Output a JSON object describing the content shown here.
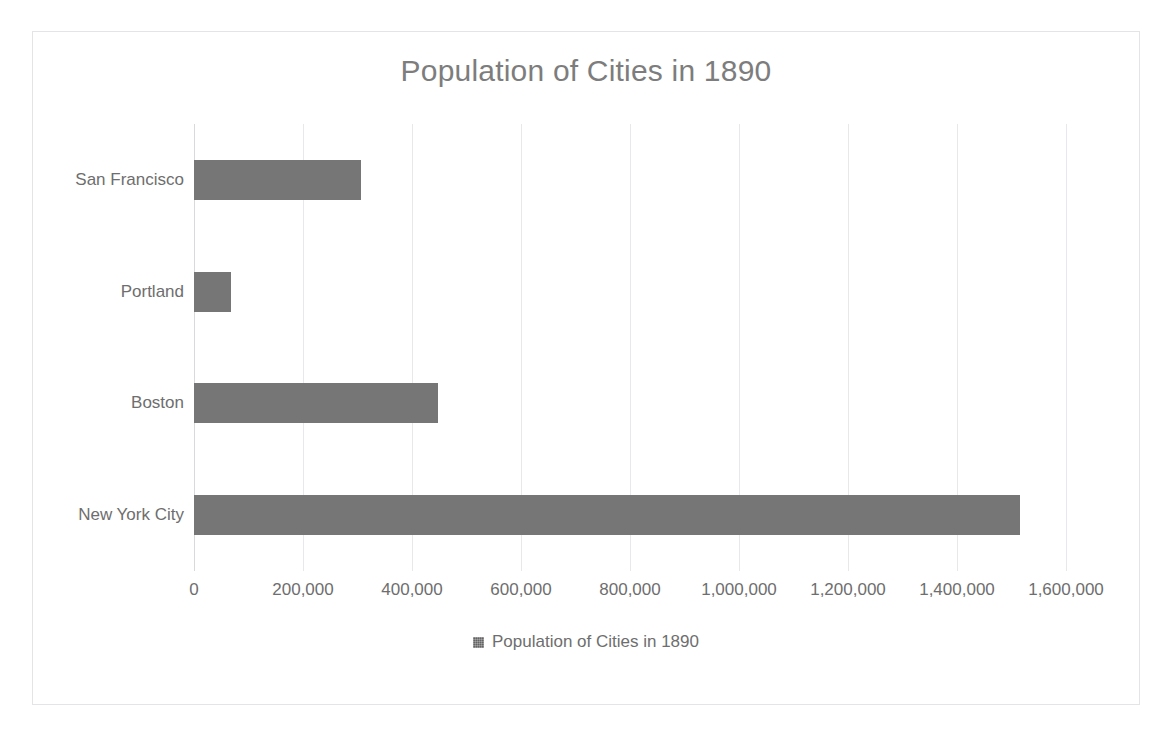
{
  "chart_data": {
    "type": "bar",
    "orientation": "horizontal",
    "title": "Population of Cities in 1890",
    "xlabel": "",
    "ylabel": "",
    "categories": [
      "New York City",
      "Boston",
      "Portland",
      "San Francisco"
    ],
    "values": [
      1515300,
      448500,
      68000,
      306500
    ],
    "series": [
      {
        "name": "Population of Cities in 1890",
        "values": [
          1515300,
          448500,
          68000,
          306500
        ]
      }
    ],
    "xlim": [
      0,
      1600000
    ],
    "xticks": [
      0,
      200000,
      400000,
      600000,
      800000,
      1000000,
      1200000,
      1400000,
      1600000
    ],
    "xtick_labels": [
      "0",
      "200,000",
      "400,000",
      "600,000",
      "800,000",
      "1,000,000",
      "1,200,000",
      "1,400,000",
      "1,600,000"
    ],
    "grid": true,
    "grid_axis": "x",
    "legend": {
      "position": "bottom",
      "entries": [
        {
          "label": "Population of Cities in 1890",
          "swatch": "legend-swatch",
          "color": "#767676"
        }
      ]
    },
    "colors": {
      "bar": "#767676",
      "title_text": "#7d7d7d",
      "tick_text": "#6e6e6e",
      "gridline": "#e8e8ea",
      "frame_border": "#e4e4e6",
      "background": "#ffffff"
    }
  }
}
